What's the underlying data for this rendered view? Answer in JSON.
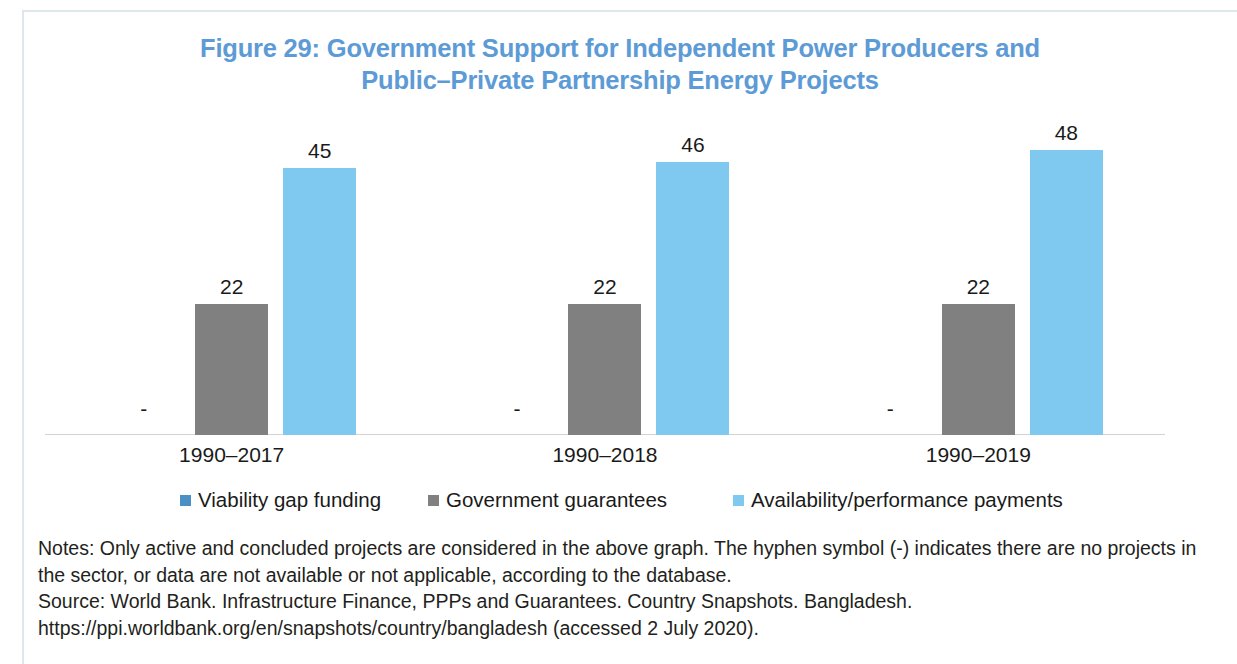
{
  "figure": {
    "title_line1": "Figure 29: Government Support for Independent Power Producers and",
    "title_line2": "Public–Private Partnership Energy Projects",
    "title_color": "#5C9BD6"
  },
  "notes": {
    "notes_text": "Notes: Only active and concluded projects are considered in the above graph. The hyphen symbol (-) indicates there are no projects in the sector, or data are not available or not applicable, according to the database.",
    "source_text": "Source: World Bank. Infrastructure Finance, PPPs and Guarantees. Country Snapshots. Bangladesh. https://ppi.worldbank.org/en/snapshots/country/bangladesh (accessed 2 July 2020)."
  },
  "chart_data": {
    "type": "bar",
    "title": "Figure 29: Government Support for Independent Power Producers and Public–Private Partnership Energy Projects",
    "xlabel": "",
    "ylabel": "",
    "ylim": [
      0,
      53
    ],
    "grid": false,
    "legend_position": "bottom",
    "missing_marker": "-",
    "categories": [
      "1990–2017",
      "1990–2018",
      "1990–2019"
    ],
    "series": [
      {
        "name": "Viability gap funding",
        "color": "#4A90C4",
        "values": [
          null,
          null,
          null
        ],
        "labels": [
          "-",
          "-",
          "-"
        ]
      },
      {
        "name": "Government guarantees",
        "color": "#808080",
        "values": [
          22,
          22,
          22
        ],
        "labels": [
          "22",
          "22",
          "22"
        ]
      },
      {
        "name": "Availability/performance payments",
        "color": "#7FC8EF",
        "values": [
          45,
          46,
          48
        ],
        "labels": [
          "45",
          "46",
          "48"
        ]
      }
    ]
  }
}
